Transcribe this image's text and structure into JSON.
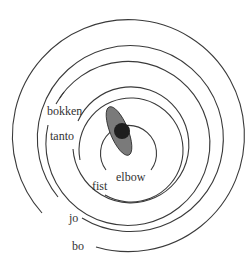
{
  "diagram": {
    "type": "concentric-range-rings",
    "labels": {
      "bo": "bo",
      "jo": "jo",
      "bokken": "bokken",
      "tanto": "tanto",
      "fist": "fist",
      "elbow": "elbow"
    },
    "rings_outer_to_inner": [
      "bo",
      "jo",
      "bokken",
      "tanto",
      "fist",
      "elbow"
    ],
    "colors": {
      "ring_stroke": "#3a3a3a",
      "body_ellipse": "#7a7a7a",
      "head_circle": "#1e1e1e",
      "label_text": "#333333",
      "background": "#ffffff"
    },
    "figure": {
      "body": "tilted grey ellipse at center",
      "head": "dark filled circle overlapping ellipse"
    }
  }
}
